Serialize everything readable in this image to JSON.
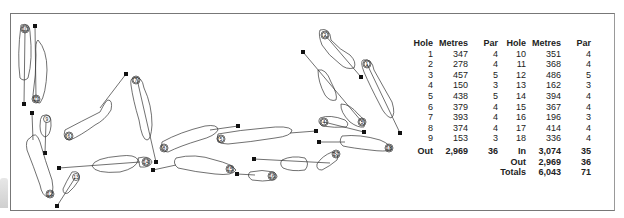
{
  "scorecard": {
    "headers": [
      "Hole",
      "Metres",
      "Par",
      "Hole",
      "Metres",
      "Par"
    ],
    "rows": [
      {
        "h1": "1",
        "m1": "347",
        "p1": "4",
        "h2": "10",
        "m2": "351",
        "p2": "4"
      },
      {
        "h1": "2",
        "m1": "278",
        "p1": "4",
        "h2": "11",
        "m2": "368",
        "p2": "4"
      },
      {
        "h1": "3",
        "m1": "457",
        "p1": "5",
        "h2": "12",
        "m2": "486",
        "p2": "5"
      },
      {
        "h1": "4",
        "m1": "150",
        "p1": "3",
        "h2": "13",
        "m2": "162",
        "p2": "3"
      },
      {
        "h1": "5",
        "m1": "438",
        "p1": "5",
        "h2": "14",
        "m2": "394",
        "p2": "4"
      },
      {
        "h1": "6",
        "m1": "379",
        "p1": "4",
        "h2": "15",
        "m2": "367",
        "p2": "4"
      },
      {
        "h1": "7",
        "m1": "393",
        "p1": "4",
        "h2": "16",
        "m2": "196",
        "p2": "3"
      },
      {
        "h1": "8",
        "m1": "374",
        "p1": "4",
        "h2": "17",
        "m2": "414",
        "p2": "4"
      },
      {
        "h1": "9",
        "m1": "153",
        "p1": "3",
        "h2": "18",
        "m2": "336",
        "p2": "4"
      }
    ],
    "totals": {
      "out_front": {
        "label": "Out",
        "metres": "2,969",
        "par": "36"
      },
      "in": {
        "label": "In",
        "metres": "3,074",
        "par": "35"
      },
      "out_back": {
        "label": "Out",
        "metres": "2,969",
        "par": "36"
      },
      "totals": {
        "label": "Totals",
        "metres": "6,043",
        "par": "71"
      }
    }
  },
  "map": {
    "hole_numbers": [
      "1",
      "2",
      "3",
      "4",
      "5",
      "6",
      "7",
      "8",
      "9",
      "10",
      "11",
      "12",
      "13",
      "14",
      "15",
      "16",
      "17",
      "18"
    ]
  }
}
